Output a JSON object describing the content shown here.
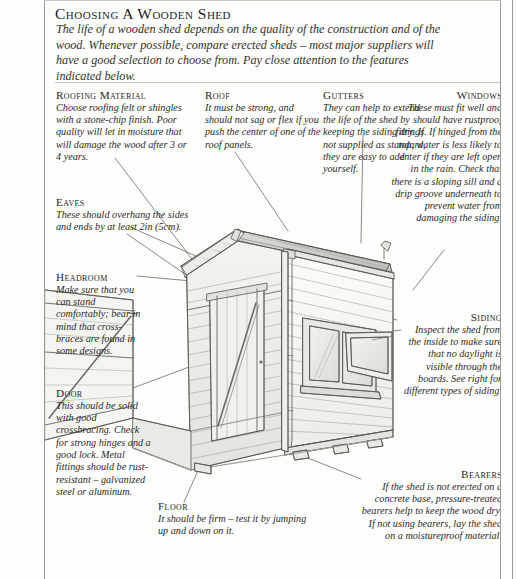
{
  "page": {
    "title": "Choosing a Wooden Shed",
    "intro": "The life of a wooden shed depends on the quality of the construction and of the wood. Whenever possible, compare erected sheds – most major suppliers will have a good selection to choose from. Pay close attention to the features indicated below."
  },
  "callouts": {
    "roofing_material": {
      "heading": "Roofing Material",
      "body": "Choose roofing felt or shingles with a stone-chip finish. Poor quality will let in moisture that will damage the wood after 3 or 4 years."
    },
    "roof": {
      "heading": "Roof",
      "body": "It must be strong, and should not sag or flex if you push the center of one of the roof panels."
    },
    "gutters": {
      "heading": "Gutters",
      "body": "They can help to extend the life of the shed by keeping the siding dry. If not supplied as standard, they are easy to add yourself."
    },
    "windows": {
      "heading": "Windows",
      "body": "These must fit well and should have rustproof fittings. If hinged from the top, water is less likely to enter if they are left open in the rain. Check that there is a sloping sill and a drip groove underneath to prevent water from damaging the siding."
    },
    "eaves": {
      "heading": "Eaves",
      "body": "These should overhang the sides and ends by at least 2in (5cm)."
    },
    "headroom": {
      "heading": "Headroom",
      "body": "Make sure that you can stand comfortably; bear in mind that cross-braces are found in some designs."
    },
    "door": {
      "heading": "Door",
      "body": "This should be solid with good crossbracing. Check for strong hinges and a good lock. Metal fittings should be rust-resistant – galvanized steel or aluminum."
    },
    "floor": {
      "heading": "Floor",
      "body": "It should be firm – test it by jumping up and down on it."
    },
    "siding": {
      "heading": "Siding",
      "body": "Inspect the shed from the inside to make sure that no daylight is visible through the boards. See right for different types of siding."
    },
    "bearers": {
      "heading": "Bearers",
      "body": "If the shed is not erected on a concrete base, pressure-treated bearers help to keep the wood dry. If not using bearers, lay the shed on a moistureproof material."
    }
  },
  "illustration": {
    "name": "wooden-shed-perspective-drawing",
    "description": "Pencil-style perspective line drawing of a wooden garden shed with apex roof, cross-braced door on the gable end, a top-hung window on the side wall, clapboard siding, a downpipe at the corner and bearers underneath.",
    "line_color": "#55554f",
    "shade_color": "#d6d6d0"
  }
}
